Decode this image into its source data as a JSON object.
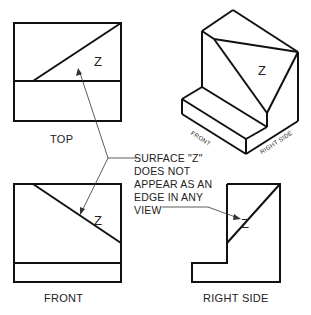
{
  "views": {
    "top": {
      "label": "TOP",
      "surface": "Z"
    },
    "front": {
      "label": "FRONT",
      "surface": "Z"
    },
    "right_side": {
      "label": "RIGHT SIDE",
      "surface": "Z"
    },
    "isometric": {
      "surface": "Z",
      "front_label": "FRONT",
      "right_side_label": "RIGHT SIDE"
    }
  },
  "note": {
    "lines": [
      "SURFACE \"Z\"",
      "DOES NOT",
      "APPEAR AS AN",
      "EDGE  IN ANY",
      "VIEW"
    ]
  },
  "colors": {
    "line": "#111111",
    "text": "#222222",
    "background": "#ffffff"
  }
}
